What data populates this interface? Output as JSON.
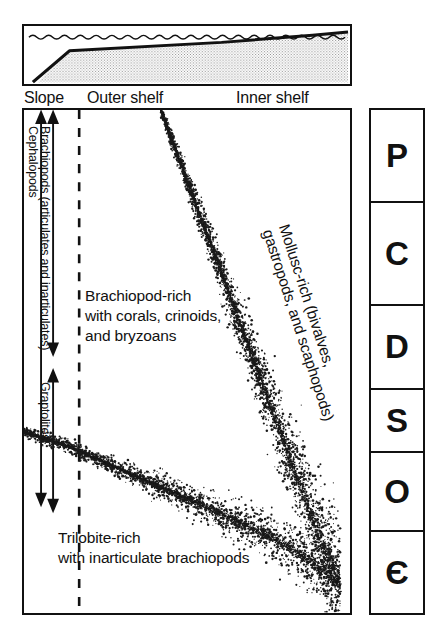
{
  "figure": {
    "type": "paleoenvironmental facies diagram"
  },
  "cross_section": {
    "name": "shelf-to-slope profile",
    "water_label": "sea surface (wavy line)",
    "zones": [
      {
        "id": "slope",
        "label": "Slope"
      },
      {
        "id": "outer-shelf",
        "label": "Outer shelf"
      },
      {
        "id": "inner-shelf",
        "label": "Inner shelf"
      }
    ]
  },
  "main_panel": {
    "facies": [
      {
        "id": "mollusc",
        "lines": [
          "Mollusc-rich (bivalves,",
          "gastropods, and scaphopods)"
        ]
      },
      {
        "id": "brachiopod",
        "lines": [
          "Brachiopod-rich",
          "with corals, crinoids,",
          "and bryzoans"
        ]
      },
      {
        "id": "trilobite",
        "lines": [
          "Trilobite-rich",
          "with inarticulate brachiopods"
        ]
      }
    ],
    "range_labels": [
      {
        "id": "brachiopods",
        "label": "Brachiopods (articulates and inarticulates)"
      },
      {
        "id": "cephalopods",
        "label": "Cephalopods"
      },
      {
        "id": "graptolites",
        "label": "Graptolites"
      }
    ],
    "dashed_divider": "slope / outer-shelf boundary"
  },
  "period_column": {
    "name": "geologic periods (youngest at top)",
    "cells": [
      {
        "symbol": "P",
        "period": "Permian"
      },
      {
        "symbol": "C",
        "period": "Carboniferous"
      },
      {
        "symbol": "D",
        "period": "Devonian"
      },
      {
        "symbol": "S",
        "period": "Silurian"
      },
      {
        "symbol": "O",
        "period": "Ordovician"
      },
      {
        "symbol": "Є",
        "period": "Cambrian"
      }
    ]
  },
  "colors": {
    "ink": "#111111",
    "paper": "#ffffff",
    "stipple": "#1a1a1a"
  },
  "chart_data": {
    "type": "scatter",
    "xlabel": "Onshore (right) to offshore (left) position",
    "ylabel": "Geologic time (Cambrian at base to Permian at top)",
    "grid": false,
    "legend": null,
    "series": [
      {
        "name": "mollusc-brachiopod facies boundary",
        "note": "dense stipple band descending from upper-left to lower-right",
        "x": [
          0.42,
          0.5,
          0.58,
          0.66,
          0.74,
          0.82,
          0.9,
          0.97
        ],
        "y": [
          1.0,
          0.86,
          0.72,
          0.58,
          0.44,
          0.3,
          0.16,
          0.06
        ]
      },
      {
        "name": "brachiopod-trilobite facies boundary",
        "note": "dense stipple band descending gently from left edge to lower-right",
        "x": [
          0.0,
          0.14,
          0.28,
          0.42,
          0.56,
          0.7,
          0.84,
          0.97
        ],
        "y": [
          0.36,
          0.33,
          0.29,
          0.25,
          0.21,
          0.17,
          0.12,
          0.06
        ]
      }
    ]
  }
}
